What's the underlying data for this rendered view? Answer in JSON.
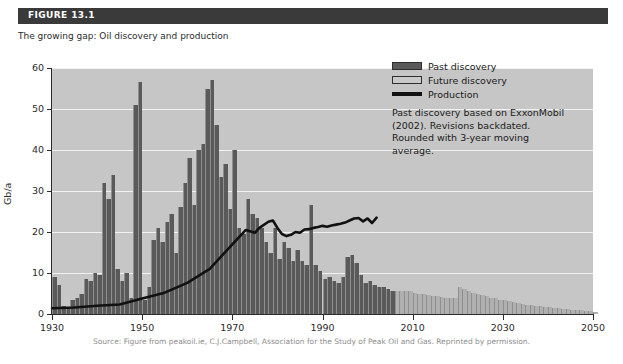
{
  "figure": {
    "label": "FIGURE 13.1",
    "caption": "The growing gap: Oil discovery and production"
  },
  "source": "Source: Figure from peakoil.ie, C.J.Campbell, Association for the Study of Peak Oil and Gas. Reprinted by permission.",
  "legend": {
    "items": [
      {
        "key": "past",
        "label": "Past discovery",
        "color": "#5a5a5a"
      },
      {
        "key": "future",
        "label": "Future discovery",
        "color": "#c9c9c9"
      },
      {
        "key": "production",
        "label": "Production",
        "color": "#111111"
      }
    ],
    "note": "Past discovery based on ExxonMobil (2002). Revisions backdated. Rounded with 3-year moving average."
  },
  "chart_data": {
    "type": "bar",
    "title": "The growing gap: Oil discovery and production",
    "xlabel": "",
    "ylabel": "Gb/a",
    "xlim": [
      1930,
      2050
    ],
    "ylim": [
      0,
      60
    ],
    "yticks": [
      0,
      10,
      20,
      30,
      40,
      50,
      60
    ],
    "xticks": [
      1930,
      1950,
      1970,
      1990,
      2010,
      2030,
      2050
    ],
    "grid": true,
    "legend_position": "top-right",
    "plot_background": "#c6c6c6",
    "series": [
      {
        "name": "Past discovery",
        "type": "bar",
        "color": "#5a5a5a",
        "x": [
          1930,
          1931,
          1932,
          1933,
          1934,
          1935,
          1936,
          1937,
          1938,
          1939,
          1940,
          1941,
          1942,
          1943,
          1944,
          1945,
          1946,
          1947,
          1948,
          1949,
          1950,
          1951,
          1952,
          1953,
          1954,
          1955,
          1956,
          1957,
          1958,
          1959,
          1960,
          1961,
          1962,
          1963,
          1964,
          1965,
          1966,
          1967,
          1968,
          1969,
          1970,
          1971,
          1972,
          1973,
          1974,
          1975,
          1976,
          1977,
          1978,
          1979,
          1980,
          1981,
          1982,
          1983,
          1984,
          1985,
          1986,
          1987,
          1988,
          1989,
          1990,
          1991,
          1992,
          1993,
          1994,
          1995,
          1996,
          1997,
          1998,
          1999,
          2000,
          2001,
          2002,
          2003,
          2004,
          2005
        ],
        "values": [
          9.0,
          7.0,
          2.0,
          1.8,
          3.5,
          4.0,
          5.0,
          8.5,
          8.0,
          10.0,
          9.5,
          32.0,
          28.0,
          34.0,
          11.0,
          8.0,
          10.0,
          4.0,
          51.0,
          56.5,
          3.5,
          6.5,
          18.0,
          21.0,
          17.5,
          22.5,
          24.5,
          15.0,
          26.0,
          32.0,
          38.0,
          26.5,
          40.0,
          41.5,
          55.0,
          57.0,
          46.0,
          33.5,
          36.5,
          25.5,
          40.0,
          21.0,
          19.5,
          28.0,
          24.5,
          23.5,
          21.0,
          17.5,
          15.0,
          21.0,
          13.5,
          17.5,
          16.0,
          13.0,
          15.5,
          13.0,
          12.0,
          26.5,
          12.0,
          10.5,
          8.5,
          9.0,
          8.0,
          7.5,
          9.0,
          14.0,
          14.5,
          12.5,
          9.5,
          7.5,
          8.0,
          7.0,
          6.5,
          6.5,
          6.0,
          5.5
        ]
      },
      {
        "name": "Future discovery",
        "type": "bar",
        "color": "#b0b0b0",
        "x": [
          2006,
          2007,
          2008,
          2009,
          2010,
          2011,
          2012,
          2013,
          2014,
          2015,
          2016,
          2017,
          2018,
          2019,
          2020,
          2021,
          2022,
          2023,
          2024,
          2025,
          2026,
          2027,
          2028,
          2029,
          2030,
          2031,
          2032,
          2033,
          2034,
          2035,
          2036,
          2037,
          2038,
          2039,
          2040,
          2041,
          2042,
          2043,
          2044,
          2045,
          2046,
          2047,
          2048,
          2049,
          2050
        ],
        "values": [
          5.5,
          5.5,
          5.5,
          5.5,
          5.2,
          5.0,
          4.8,
          4.6,
          4.5,
          4.4,
          4.2,
          4.0,
          3.9,
          3.8,
          6.5,
          6.0,
          5.6,
          5.2,
          4.9,
          4.6,
          4.3,
          4.0,
          3.8,
          3.5,
          3.3,
          3.1,
          2.9,
          2.7,
          2.5,
          2.3,
          2.2,
          2.0,
          1.9,
          1.7,
          1.6,
          1.5,
          1.4,
          1.3,
          1.2,
          1.1,
          1.0,
          0.9,
          0.8,
          0.7,
          0.6
        ]
      },
      {
        "name": "Production",
        "type": "line",
        "color": "#111111",
        "x": [
          1930,
          1935,
          1940,
          1945,
          1950,
          1955,
          1960,
          1965,
          1970,
          1973,
          1975,
          1976,
          1978,
          1979,
          1980,
          1981,
          1982,
          1983,
          1984,
          1985,
          1986,
          1987,
          1988,
          1989,
          1990,
          1991,
          1992,
          1993,
          1994,
          1995,
          1996,
          1997,
          1998,
          1999,
          2000,
          2001,
          2002
        ],
        "values": [
          1.4,
          1.6,
          2.0,
          2.3,
          3.8,
          5.2,
          7.6,
          11.0,
          17.0,
          20.5,
          19.8,
          21.0,
          22.5,
          22.8,
          21.0,
          19.5,
          19.0,
          19.3,
          20.0,
          19.8,
          20.6,
          20.7,
          21.0,
          21.2,
          21.5,
          21.3,
          21.6,
          21.8,
          22.0,
          22.3,
          22.8,
          23.3,
          23.4,
          22.6,
          23.3,
          22.2,
          23.5
        ]
      }
    ]
  }
}
